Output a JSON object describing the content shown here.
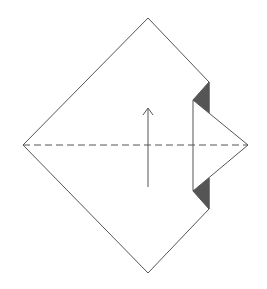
{
  "diagram": {
    "type": "origami-fold-step",
    "colors": {
      "background": "#ffffff",
      "line": "#555555",
      "paper_back": "#555555",
      "paper_front": "#ffffff"
    },
    "vertices": {
      "top": [
        148,
        18
      ],
      "bottom": [
        148,
        273
      ],
      "left": [
        23,
        145
      ],
      "right_tip": [
        248,
        145
      ]
    },
    "elements": [
      {
        "name": "square-outline",
        "description": "diamond-shaped paper square"
      },
      {
        "name": "valley-fold-line",
        "description": "horizontal dashed line through center"
      },
      {
        "name": "folded-flap",
        "description": "right corner folded inward with triangular tip"
      },
      {
        "name": "fold-up-arrow",
        "description": "arrow pointing up indicating fold direction"
      }
    ]
  }
}
